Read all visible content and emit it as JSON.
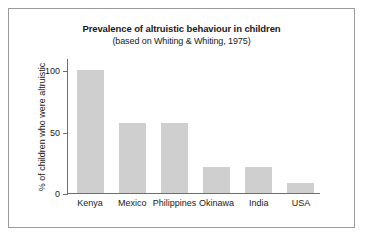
{
  "chart_data": {
    "type": "bar",
    "title": "Prevalence of altruistic behaviour in children",
    "subtitle": "(based on Whiting & Whiting, 1975)",
    "xlabel": "",
    "ylabel": "% of children who were altruistic",
    "categories": [
      "Kenya",
      "Mexico",
      "Philippines",
      "Okinawa",
      "India",
      "USA"
    ],
    "values": [
      100,
      57,
      57,
      21,
      21,
      8
    ],
    "ylim": [
      0,
      110
    ],
    "yticks": [
      0,
      50,
      100
    ],
    "ytick_labels": [
      "0",
      "50",
      "100"
    ],
    "grid": false,
    "legend": false,
    "bar_color": "#cfcfcf",
    "axis_color": "#6e6e6e",
    "frame_color": "#9a9a9a",
    "text_color": "#1a1a1a"
  }
}
